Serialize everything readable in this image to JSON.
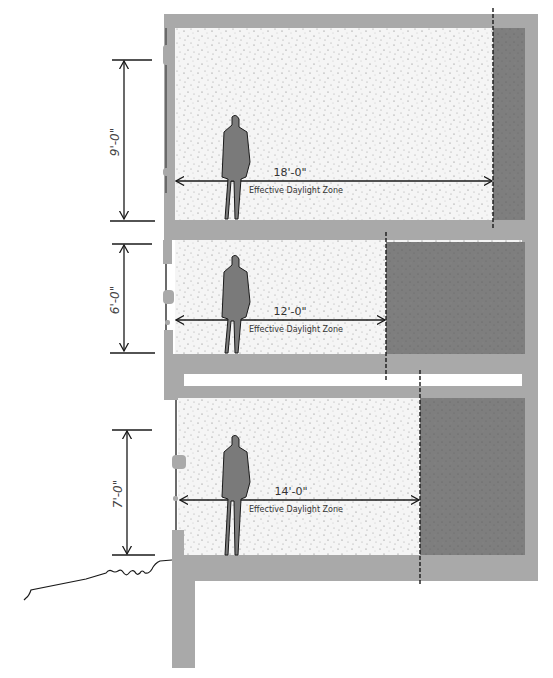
{
  "diagram": {
    "colors": {
      "structure": "#a9a9a9",
      "dark_zone": "#7d7d7d",
      "interior": "#f4f4f4",
      "line": "#1a1a1a"
    },
    "floors": [
      {
        "id": "floor-top",
        "window_height_label": "9'-0\"",
        "daylight_depth_label": "18'-0\"",
        "zone_label": "Effective Daylight Zone"
      },
      {
        "id": "floor-middle",
        "window_height_label": "6'-0\"",
        "daylight_depth_label": "12'-0\"",
        "zone_label": "Effective Daylight Zone"
      },
      {
        "id": "floor-bottom",
        "window_height_label": "7'-0\"",
        "daylight_depth_label": "14'-0\"",
        "zone_label": "Effective Daylight Zone"
      }
    ]
  }
}
